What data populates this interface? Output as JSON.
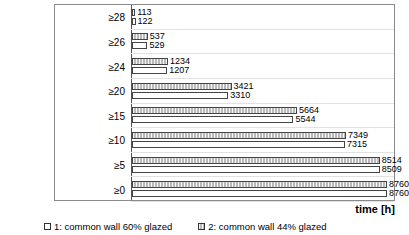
{
  "chart_data": {
    "type": "bar",
    "orientation": "horizontal",
    "title": "",
    "xlabel": "time [h]",
    "ylabel": "T [°C]",
    "categories": [
      "≥28",
      "≥26",
      "≥24",
      "≥20",
      "≥15",
      "≥10",
      "≥5",
      "≥0"
    ],
    "xlim": [
      0,
      8760
    ],
    "grid": true,
    "legend_position": "bottom",
    "series": [
      {
        "name": "1: common wall 60% glazed",
        "key": "1",
        "style": "hollow-white",
        "values": [
          122,
          529,
          1207,
          3310,
          5544,
          7315,
          8509,
          8760
        ]
      },
      {
        "name": "2: common wall 44% glazed",
        "key": "2",
        "style": "gray-hatched",
        "values": [
          113,
          537,
          1234,
          3421,
          5664,
          7349,
          8514,
          8760
        ]
      }
    ]
  },
  "axes": {
    "y_title": "T [°C]",
    "x_title": "time [h]"
  },
  "legend": {
    "items": [
      {
        "label": "1: common wall 60% glazed"
      },
      {
        "label": "2: common wall 44% glazed"
      }
    ]
  },
  "colors": {
    "series1_fill": "#ffffff",
    "series2_fill": "#b9b9b9",
    "bar_border": "#444444",
    "frame": "#8a8a8a",
    "gridline": "#e2e2e2"
  }
}
